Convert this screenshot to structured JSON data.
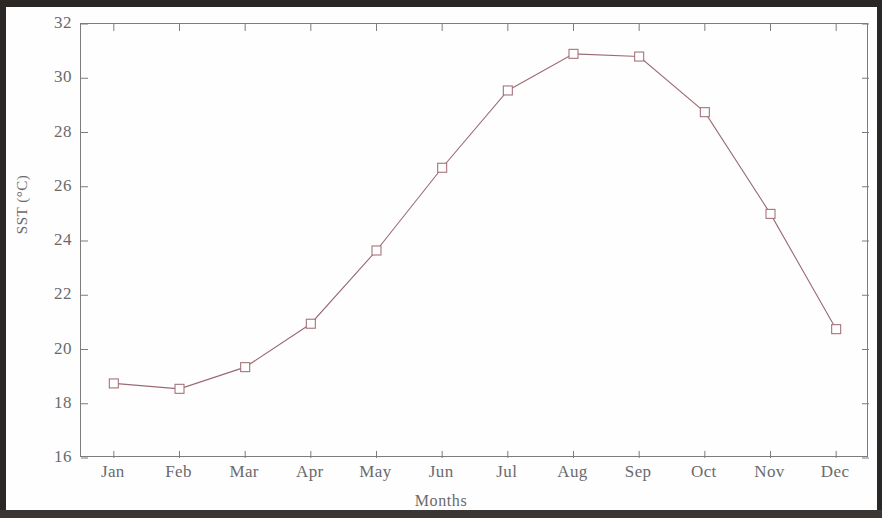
{
  "chart_data": {
    "type": "line",
    "title": "",
    "subtitle": "",
    "xlabel": "Months",
    "ylabel": "SST (°C)",
    "categories": [
      "Jan",
      "Feb",
      "Mar",
      "Apr",
      "May",
      "Jun",
      "Jul",
      "Aug",
      "Sep",
      "Oct",
      "Nov",
      "Dec"
    ],
    "values": [
      18.75,
      18.55,
      19.35,
      20.95,
      23.65,
      26.7,
      29.55,
      30.9,
      30.8,
      28.75,
      25.0,
      20.75
    ],
    "series": [
      {
        "name": "SST",
        "values": [
          18.75,
          18.55,
          19.35,
          20.95,
          23.65,
          26.7,
          29.55,
          30.9,
          30.8,
          28.75,
          25.0,
          20.75
        ]
      }
    ],
    "ylim": [
      16,
      32
    ],
    "y_ticks": [
      16,
      18,
      20,
      22,
      24,
      26,
      28,
      30,
      32
    ],
    "y_tick_labels": [
      "16",
      "18",
      "20",
      "22",
      "24",
      "26",
      "28",
      "30",
      "32"
    ],
    "x_ticks": [
      "Jan",
      "Feb",
      "Mar",
      "Apr",
      "May",
      "Jun",
      "Jul",
      "Aug",
      "Sep",
      "Oct",
      "Nov",
      "Dec"
    ],
    "grid": false,
    "legend": false,
    "legend_position": "none",
    "marker": "open-square",
    "line_color": "#9a6a72",
    "marker_edge_color": "#a5737b",
    "marker_face_color": "#ffffff",
    "axis_color": "#7c7c80",
    "text_color": "#6a6a6e",
    "background_color": "#ffffff"
  }
}
